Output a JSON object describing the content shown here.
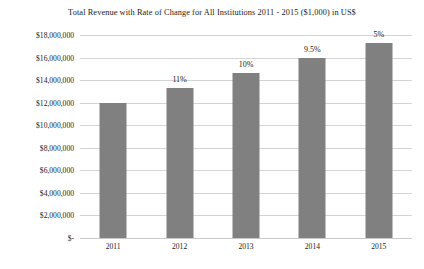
{
  "chart_data": {
    "type": "bar",
    "title": "Total Revenue with Rate of Change for All Institutions 2011 - 2015 ($1,000) in US$",
    "xlabel": "",
    "ylabel": "",
    "categories": [
      "2011",
      "2012",
      "2013",
      "2014",
      "2015"
    ],
    "values": [
      12000000,
      13300000,
      14600000,
      16000000,
      17300000
    ],
    "point_labels": [
      "",
      "11%",
      "10%",
      "9.5%",
      "5%"
    ],
    "series": [
      {
        "name": "Total Revenue",
        "values": [
          12000000,
          13300000,
          14600000,
          16000000,
          17300000
        ]
      },
      {
        "name": "Rate of Change",
        "values": [
          null,
          11,
          10,
          9.5,
          5
        ]
      }
    ],
    "ylim": [
      0,
      18000000
    ],
    "ytick_values": [
      18000000,
      16000000,
      14000000,
      12000000,
      10000000,
      8000000,
      6000000,
      4000000,
      2000000,
      0
    ],
    "ytick_labels": [
      "$18,000,000",
      "$16,000,000",
      "$14,000,000",
      "$12,000,000",
      "$10,000,000",
      "$8,000,000",
      "$6,000,000",
      "$4,000,000",
      "$2,000,000",
      "$-"
    ],
    "grid": true,
    "legend": false,
    "legend_position": "none",
    "bar_color": "#808080",
    "gridline_color": "#d4d4d4",
    "background_color": "#ffffff"
  }
}
